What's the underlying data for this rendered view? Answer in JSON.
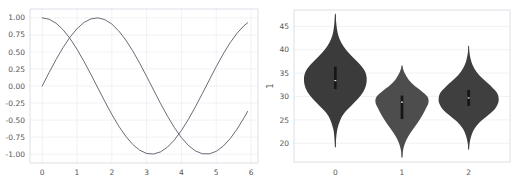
{
  "figure": {
    "background": "#ffffff",
    "panels": [
      "line-plot",
      "violin-plot"
    ]
  },
  "chart_data": [
    {
      "type": "line",
      "title": "",
      "xlabel": "",
      "ylabel": "",
      "xlim": [
        -0.35,
        6.2
      ],
      "ylim": [
        -1.13,
        1.13
      ],
      "grid": true,
      "legend": null,
      "xticks": [
        "0",
        "1",
        "2",
        "3",
        "4",
        "5",
        "6"
      ],
      "xtick_values": [
        0,
        1,
        2,
        3,
        4,
        5,
        6
      ],
      "yticks": [
        "1.00",
        "0.75",
        "0.50",
        "0.25",
        "0.00",
        "-0.25",
        "-0.50",
        "-0.75",
        "-1.00"
      ],
      "ytick_values": [
        1.0,
        0.75,
        0.5,
        0.25,
        0.0,
        -0.25,
        -0.5,
        -0.75,
        -1.0
      ],
      "series": [
        {
          "name": "sin",
          "color": "#5a5a66",
          "x": [
            0.0,
            0.2,
            0.4,
            0.6,
            0.8,
            1.0,
            1.2,
            1.4,
            1.6,
            1.8,
            2.0,
            2.2,
            2.4,
            2.6,
            2.8,
            3.0,
            3.2,
            3.4,
            3.6,
            3.8,
            4.0,
            4.2,
            4.4,
            4.6,
            4.8,
            5.0,
            5.2,
            5.4,
            5.6,
            5.8,
            5.9
          ],
          "values": [
            0.0,
            0.199,
            0.389,
            0.565,
            0.717,
            0.841,
            0.932,
            0.985,
            1.0,
            0.974,
            0.909,
            0.808,
            0.675,
            0.516,
            0.335,
            0.141,
            -0.058,
            -0.256,
            -0.443,
            -0.612,
            -0.757,
            -0.872,
            -0.952,
            -0.994,
            -0.996,
            -0.959,
            -0.883,
            -0.773,
            -0.631,
            -0.465,
            -0.374
          ]
        },
        {
          "name": "cos",
          "color": "#5a5a66",
          "x": [
            0.0,
            0.2,
            0.4,
            0.6,
            0.8,
            1.0,
            1.2,
            1.4,
            1.6,
            1.8,
            2.0,
            2.2,
            2.4,
            2.6,
            2.8,
            3.0,
            3.2,
            3.4,
            3.6,
            3.8,
            4.0,
            4.2,
            4.4,
            4.6,
            4.8,
            5.0,
            5.2,
            5.4,
            5.6,
            5.8,
            5.9
          ],
          "values": [
            1.0,
            0.98,
            0.921,
            0.825,
            0.697,
            0.54,
            0.362,
            0.17,
            -0.029,
            -0.227,
            -0.416,
            -0.589,
            -0.737,
            -0.857,
            -0.942,
            -0.99,
            -0.998,
            -0.967,
            -0.897,
            -0.791,
            -0.654,
            -0.49,
            -0.307,
            -0.112,
            0.087,
            0.284,
            0.469,
            0.635,
            0.776,
            0.886,
            0.927
          ]
        }
      ]
    },
    {
      "type": "violin",
      "title": "",
      "xlabel": "",
      "ylabel": "1",
      "ylim": [
        16.0,
        48.5
      ],
      "xlim": [
        -0.62,
        2.62
      ],
      "grid": true,
      "legend": null,
      "xticks": [
        "0",
        "1",
        "2"
      ],
      "xtick_values": [
        0,
        1,
        2
      ],
      "yticks": [
        "20",
        "25",
        "30",
        "35",
        "40",
        "45"
      ],
      "ytick_values": [
        20,
        25,
        30,
        35,
        40,
        45
      ],
      "groups": [
        {
          "label": "0",
          "color": "#3b3b3b",
          "min": 19.2,
          "max": 47.6,
          "q1": 31.6,
          "median": 33.4,
          "q3": 36.4,
          "mode": 34.0,
          "max_width": 0.47,
          "density": [
            {
              "y": 19.2,
              "w": 0.004
            },
            {
              "y": 21.0,
              "w": 0.012
            },
            {
              "y": 23.0,
              "w": 0.03
            },
            {
              "y": 25.0,
              "w": 0.075
            },
            {
              "y": 26.5,
              "w": 0.135
            },
            {
              "y": 28.0,
              "w": 0.235
            },
            {
              "y": 29.5,
              "w": 0.34
            },
            {
              "y": 31.0,
              "w": 0.42
            },
            {
              "y": 32.5,
              "w": 0.462
            },
            {
              "y": 34.0,
              "w": 0.47
            },
            {
              "y": 35.5,
              "w": 0.44
            },
            {
              "y": 37.0,
              "w": 0.36
            },
            {
              "y": 38.5,
              "w": 0.255
            },
            {
              "y": 40.0,
              "w": 0.16
            },
            {
              "y": 41.5,
              "w": 0.09
            },
            {
              "y": 43.0,
              "w": 0.046
            },
            {
              "y": 44.5,
              "w": 0.024
            },
            {
              "y": 46.0,
              "w": 0.012
            },
            {
              "y": 47.6,
              "w": 0.004
            }
          ]
        },
        {
          "label": "1",
          "color": "#4d4d4d",
          "min": 17.0,
          "max": 36.6,
          "q1": 25.2,
          "median": 28.8,
          "q3": 30.2,
          "mode": 29.2,
          "max_width": 0.4,
          "density": [
            {
              "y": 17.0,
              "w": 0.004
            },
            {
              "y": 18.5,
              "w": 0.016
            },
            {
              "y": 20.0,
              "w": 0.045
            },
            {
              "y": 21.5,
              "w": 0.095
            },
            {
              "y": 23.0,
              "w": 0.165
            },
            {
              "y": 24.5,
              "w": 0.24
            },
            {
              "y": 26.0,
              "w": 0.305
            },
            {
              "y": 27.5,
              "w": 0.36
            },
            {
              "y": 28.8,
              "w": 0.398
            },
            {
              "y": 30.0,
              "w": 0.38
            },
            {
              "y": 31.2,
              "w": 0.29
            },
            {
              "y": 32.4,
              "w": 0.18
            },
            {
              "y": 33.6,
              "w": 0.1
            },
            {
              "y": 34.8,
              "w": 0.048
            },
            {
              "y": 36.0,
              "w": 0.014
            },
            {
              "y": 36.6,
              "w": 0.004
            }
          ]
        },
        {
          "label": "2",
          "color": "#3f3f3f",
          "min": 18.7,
          "max": 40.8,
          "q1": 28.0,
          "median": 29.7,
          "q3": 31.4,
          "mode": 29.6,
          "max_width": 0.45,
          "density": [
            {
              "y": 18.7,
              "w": 0.004
            },
            {
              "y": 20.0,
              "w": 0.014
            },
            {
              "y": 21.5,
              "w": 0.038
            },
            {
              "y": 23.0,
              "w": 0.082
            },
            {
              "y": 24.5,
              "w": 0.165
            },
            {
              "y": 26.0,
              "w": 0.29
            },
            {
              "y": 27.3,
              "w": 0.39
            },
            {
              "y": 28.5,
              "w": 0.44
            },
            {
              "y": 29.6,
              "w": 0.45
            },
            {
              "y": 30.8,
              "w": 0.425
            },
            {
              "y": 32.0,
              "w": 0.35
            },
            {
              "y": 33.3,
              "w": 0.25
            },
            {
              "y": 34.6,
              "w": 0.155
            },
            {
              "y": 36.0,
              "w": 0.085
            },
            {
              "y": 37.4,
              "w": 0.042
            },
            {
              "y": 38.8,
              "w": 0.018
            },
            {
              "y": 40.0,
              "w": 0.007
            },
            {
              "y": 40.8,
              "w": 0.003
            }
          ]
        }
      ]
    }
  ]
}
